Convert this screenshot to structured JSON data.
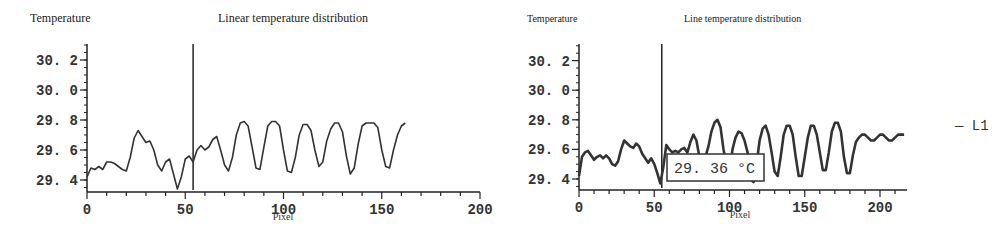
{
  "chart_data": [
    {
      "type": "line",
      "title": "Linear temperature distribution",
      "ylabel": "Temperature",
      "xlabel": "Pixel",
      "xlim": [
        0,
        200
      ],
      "ylim": [
        29.35,
        30.3
      ],
      "xticks": [
        0,
        50,
        100,
        150,
        200
      ],
      "xtick_labels": [
        "0",
        "50",
        "100",
        "150",
        "200"
      ],
      "yticks": [
        29.4,
        29.6,
        29.8,
        30.0,
        30.2
      ],
      "ytick_labels": [
        "29.4",
        "29.6",
        "29.8",
        "30.0",
        "30.2"
      ],
      "grid": false,
      "cursor_x": 54,
      "series": [
        {
          "name": "temperature",
          "x": [
            0,
            2,
            4,
            6,
            8,
            10,
            12,
            14,
            16,
            18,
            20,
            22,
            24,
            26,
            28,
            30,
            32,
            34,
            36,
            38,
            40,
            42,
            44,
            46,
            48,
            50,
            52,
            54,
            56,
            58,
            60,
            62,
            64,
            66,
            68,
            70,
            72,
            74,
            76,
            78,
            80,
            82,
            84,
            86,
            88,
            90,
            92,
            94,
            96,
            98,
            100,
            102,
            104,
            106,
            108,
            110,
            112,
            114,
            116,
            118,
            120,
            122,
            124,
            126,
            128,
            130,
            132,
            134,
            136,
            138,
            140,
            142,
            144,
            146,
            148,
            150,
            152,
            154,
            156,
            158,
            160,
            162,
            164,
            166,
            168,
            170,
            172,
            174,
            176,
            178,
            180,
            182,
            184,
            186,
            188,
            190,
            192,
            194,
            196,
            198,
            200
          ],
          "values": [
            29.42,
            29.48,
            29.47,
            29.49,
            29.47,
            29.52,
            29.52,
            29.51,
            29.49,
            29.47,
            29.46,
            29.55,
            29.68,
            29.73,
            29.69,
            29.65,
            29.66,
            29.6,
            29.5,
            29.46,
            29.52,
            29.54,
            29.44,
            29.34,
            29.42,
            29.54,
            29.56,
            29.52,
            29.6,
            29.63,
            29.6,
            29.62,
            29.67,
            29.69,
            29.6,
            29.5,
            29.46,
            29.55,
            29.7,
            29.78,
            29.79,
            29.76,
            29.62,
            29.48,
            29.47,
            29.62,
            29.76,
            29.79,
            29.79,
            29.76,
            29.6,
            29.46,
            29.45,
            29.55,
            29.7,
            29.77,
            29.77,
            29.73,
            29.6,
            29.49,
            29.52,
            29.66,
            29.74,
            29.78,
            29.78,
            29.72,
            29.56,
            29.44,
            29.48,
            29.64,
            29.76,
            29.78,
            29.78,
            29.78,
            29.75,
            29.6,
            29.49,
            29.48,
            29.6,
            29.7,
            29.76,
            29.78
          ]
        }
      ]
    },
    {
      "type": "line",
      "title": "Line temperature distribution",
      "ylabel": "Temperature",
      "xlabel": "Pixel",
      "xlim": [
        0,
        218
      ],
      "ylim": [
        29.35,
        30.3
      ],
      "xticks": [
        0,
        50,
        100,
        150,
        200
      ],
      "xtick_labels": [
        "0",
        "50",
        "100",
        "150",
        "200"
      ],
      "yticks": [
        29.4,
        29.6,
        29.8,
        30.0,
        30.2
      ],
      "ytick_labels": [
        "29.4",
        "29.6",
        "29.8",
        "30.0",
        "30.2"
      ],
      "grid": false,
      "cursor_x": 55,
      "annotation": "29.36 °C",
      "legend": [
        "L1"
      ],
      "legend_position": "right",
      "series": [
        {
          "name": "L1",
          "x": [
            0,
            2,
            4,
            6,
            8,
            10,
            12,
            14,
            16,
            18,
            20,
            22,
            24,
            26,
            28,
            30,
            32,
            34,
            36,
            38,
            40,
            42,
            44,
            46,
            48,
            50,
            52,
            54,
            56,
            58,
            60,
            62,
            64,
            66,
            68,
            70,
            72,
            74,
            76,
            78,
            80,
            82,
            84,
            86,
            88,
            90,
            92,
            94,
            96,
            98,
            100,
            102,
            104,
            106,
            108,
            110,
            112,
            114,
            116,
            118,
            120,
            122,
            124,
            126,
            128,
            130,
            132,
            134,
            136,
            138,
            140,
            142,
            144,
            146,
            148,
            150,
            152,
            154,
            156,
            158,
            160,
            162,
            164,
            166,
            168,
            170,
            172,
            174,
            176,
            178,
            180,
            182,
            184,
            186,
            188,
            190,
            192,
            194,
            196,
            198,
            200,
            202,
            204,
            206,
            208,
            210,
            212,
            214,
            216
          ],
          "values": [
            29.42,
            29.55,
            29.58,
            29.59,
            29.56,
            29.53,
            29.55,
            29.56,
            29.54,
            29.56,
            29.54,
            29.5,
            29.49,
            29.52,
            29.6,
            29.66,
            29.64,
            29.62,
            29.61,
            29.64,
            29.62,
            29.57,
            29.54,
            29.51,
            29.54,
            29.5,
            29.44,
            29.37,
            29.48,
            29.63,
            29.6,
            29.58,
            29.59,
            29.58,
            29.6,
            29.61,
            29.58,
            29.65,
            29.7,
            29.66,
            29.55,
            29.52,
            29.55,
            29.62,
            29.72,
            29.78,
            29.8,
            29.75,
            29.6,
            29.5,
            29.45,
            29.6,
            29.68,
            29.72,
            29.71,
            29.66,
            29.58,
            29.4,
            29.38,
            29.5,
            29.66,
            29.74,
            29.76,
            29.7,
            29.58,
            29.45,
            29.42,
            29.55,
            29.7,
            29.76,
            29.76,
            29.7,
            29.55,
            29.42,
            29.42,
            29.55,
            29.68,
            29.76,
            29.76,
            29.7,
            29.58,
            29.46,
            29.46,
            29.58,
            29.72,
            29.78,
            29.78,
            29.72,
            29.55,
            29.44,
            29.44,
            29.56,
            29.65,
            29.68,
            29.7,
            29.7,
            29.68,
            29.66,
            29.66,
            29.68,
            29.7,
            29.7,
            29.68,
            29.66,
            29.66,
            29.68,
            29.7,
            29.7,
            29.7
          ]
        }
      ]
    }
  ]
}
